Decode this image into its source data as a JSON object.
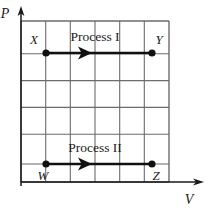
{
  "figure": {
    "type": "pv-diagram",
    "axes": {
      "y_label": "P",
      "x_label": "V"
    },
    "grid": {
      "columns": 6,
      "rows": 6,
      "left": 21,
      "right": 169,
      "top": 21,
      "bottom": 182,
      "line_color": "#6b6b6b"
    },
    "processes": [
      {
        "id": "process-1",
        "label": "Process I",
        "label_x": 95,
        "label_y": 41,
        "start_point": "X",
        "end_point": "Y",
        "y": 53,
        "x_start": 46,
        "x_end": 152,
        "arrow_x": 86,
        "direction": "right",
        "color": "#111111"
      },
      {
        "id": "process-2",
        "label": "Process II",
        "label_x": 95,
        "label_y": 152,
        "start_point": "W",
        "end_point": "Z",
        "y": 164,
        "x_start": 46,
        "x_end": 152,
        "arrow_x": 86,
        "direction": "right",
        "color": "#111111"
      }
    ],
    "points": [
      {
        "id": "point-x",
        "label": "X",
        "x": 46,
        "y": 53,
        "label_x": 34,
        "label_y": 44,
        "radius": 3.6
      },
      {
        "id": "point-y",
        "label": "Y",
        "x": 152,
        "y": 53,
        "label_x": 158,
        "label_y": 44,
        "radius": 3.6
      },
      {
        "id": "point-w",
        "label": "W",
        "x": 46,
        "y": 164,
        "label_x": 41,
        "label_y": 180,
        "radius": 3.6
      },
      {
        "id": "point-z",
        "label": "Z",
        "x": 152,
        "y": 164,
        "label_x": 156,
        "label_y": 180,
        "radius": 3.6
      }
    ],
    "colors": {
      "grid": "#6b6b6b",
      "axis": "#1a1a1a",
      "process": "#111111",
      "background": "#ffffff"
    }
  }
}
